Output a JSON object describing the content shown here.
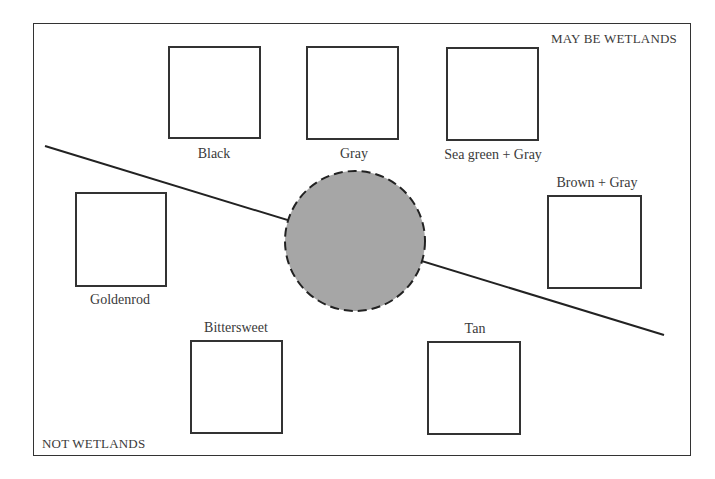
{
  "regions": {
    "upper": "MAY BE WETLANDS",
    "lower": "NOT WETLANDS"
  },
  "center_circle": {
    "fill": "#a6a6a6",
    "border": "dashed",
    "cx": 355,
    "cy": 241,
    "r": 70
  },
  "divider_line": {
    "x1": 45,
    "y1": 146,
    "x2": 664,
    "y2": 335
  },
  "swatches": [
    {
      "label": "Black",
      "region": "upper"
    },
    {
      "label": "Gray",
      "region": "upper"
    },
    {
      "label": "Sea green + Gray",
      "region": "upper"
    },
    {
      "label": "Brown + Gray",
      "region": "upper"
    },
    {
      "label": "Goldenrod",
      "region": "lower"
    },
    {
      "label": "Bittersweet",
      "region": "lower"
    },
    {
      "label": "Tan",
      "region": "lower"
    }
  ]
}
